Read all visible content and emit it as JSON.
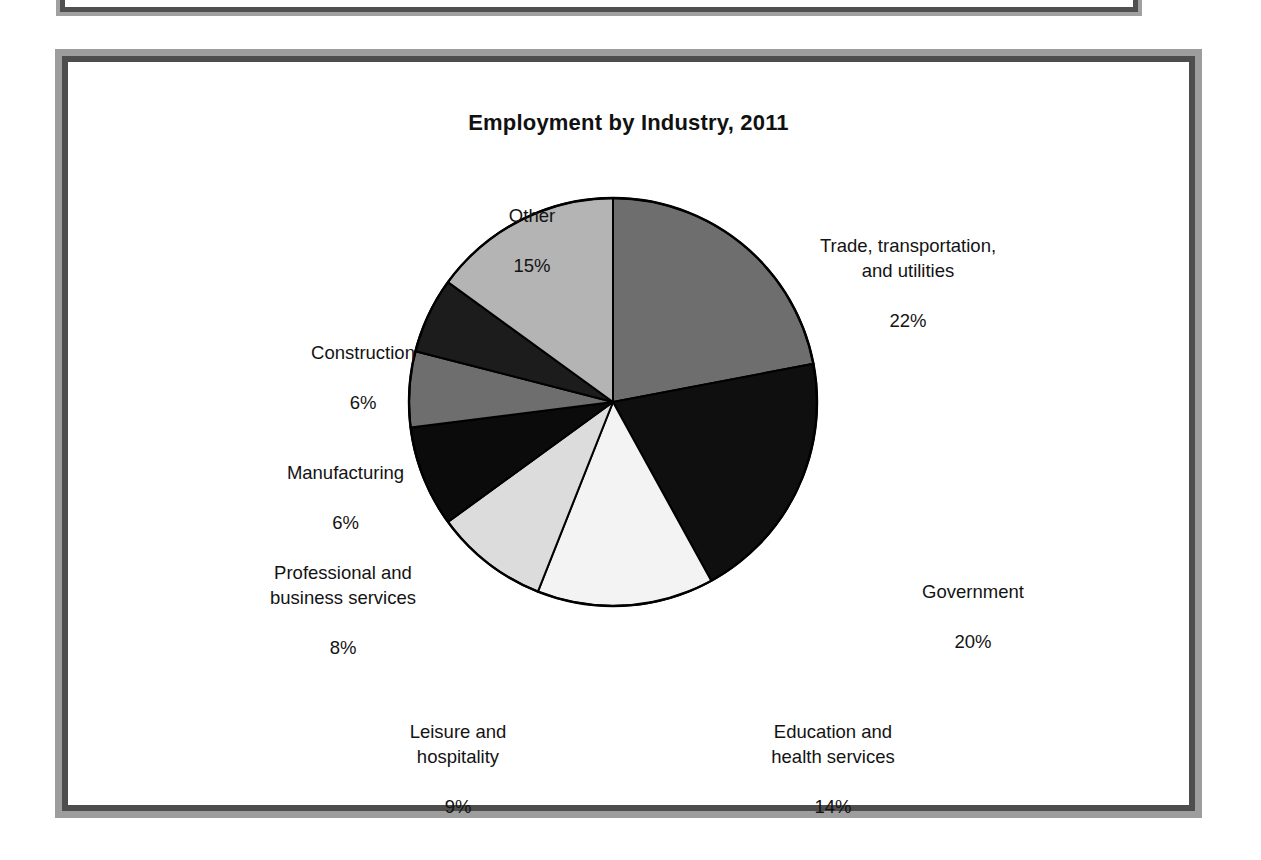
{
  "figure": {
    "title": "Employment by Industry, 2011"
  },
  "chart_data": {
    "type": "pie",
    "title": "Employment by Industry, 2011",
    "xlabel": "",
    "ylabel": "",
    "units": "percent",
    "legend_position": "none",
    "labels_outside": true,
    "start_angle_deg": 0,
    "direction": "clockwise",
    "categories": [
      "Trade, transportation, and utilities",
      "Government",
      "Education and health services",
      "Leisure and hospitality",
      "Professional and business services",
      "Manufacturing",
      "Construction",
      "Other"
    ],
    "values": [
      22,
      20,
      14,
      9,
      8,
      6,
      6,
      15
    ],
    "slices": [
      {
        "name": "Trade, transportation, and utilities",
        "label_lines": [
          "Trade, transportation,",
          "and utilities"
        ],
        "percent_label": "22%",
        "value": 22,
        "color": "#6e6e6e"
      },
      {
        "name": "Government",
        "label_lines": [
          "Government"
        ],
        "percent_label": "20%",
        "value": 20,
        "color": "#0f0f0f"
      },
      {
        "name": "Education and health services",
        "label_lines": [
          "Education and",
          "health services"
        ],
        "percent_label": "14%",
        "value": 14,
        "color": "#f3f3f3"
      },
      {
        "name": "Leisure and hospitality",
        "label_lines": [
          "Leisure and",
          "hospitality"
        ],
        "percent_label": "9%",
        "value": 9,
        "color": "#dcdcdc"
      },
      {
        "name": "Professional and business services",
        "label_lines": [
          "Professional and",
          "business services"
        ],
        "percent_label": "8%",
        "value": 8,
        "color": "#0b0b0b"
      },
      {
        "name": "Manufacturing",
        "label_lines": [
          "Manufacturing"
        ],
        "percent_label": "6%",
        "value": 6,
        "color": "#6e6e6e"
      },
      {
        "name": "Construction",
        "label_lines": [
          "Construction"
        ],
        "percent_label": "6%",
        "value": 6,
        "color": "#1c1c1c"
      },
      {
        "name": "Other",
        "label_lines": [
          "Other"
        ],
        "percent_label": "15%",
        "value": 15,
        "color": "#b4b4b4"
      }
    ]
  },
  "labels": {
    "trade": {
      "name": "Trade, transportation,\nand utilities",
      "pct": "22%"
    },
    "government": {
      "name": "Government",
      "pct": "20%"
    },
    "education": {
      "name": "Education and\nhealth services",
      "pct": "14%"
    },
    "leisure": {
      "name": "Leisure and\nhospitality",
      "pct": "9%"
    },
    "professional": {
      "name": "Professional and\nbusiness services",
      "pct": "8%"
    },
    "manufacturing": {
      "name": "Manufacturing",
      "pct": "6%"
    },
    "construction": {
      "name": "Construction",
      "pct": "6%"
    },
    "other": {
      "name": "Other",
      "pct": "15%"
    }
  },
  "style": {
    "frame_inner_border": "#4d4d4d",
    "frame_outer_border": "#9d9d9d",
    "slice_outline": "#000000",
    "page_background": "#ffffff",
    "text_color": "#131313"
  }
}
